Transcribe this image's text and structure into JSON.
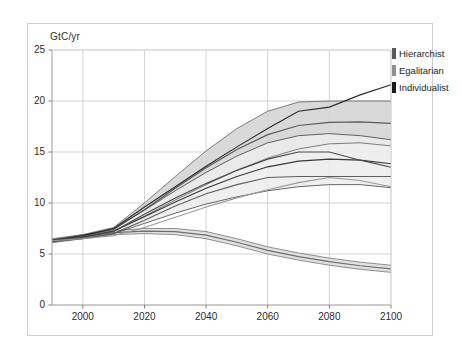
{
  "figure": {
    "unit_label": "GtC/yr",
    "frame": {
      "border_color": "#cfcfcf",
      "background": "#ffffff"
    }
  },
  "legend": {
    "position": "top-right-outside",
    "entries": [
      {
        "label": "Hierarchist",
        "swatch_color": "#5a5a5a"
      },
      {
        "label": "Egalitarian",
        "swatch_color": "#8f8f8f"
      },
      {
        "label": "Individualist",
        "swatch_color": "#1a1a1a"
      }
    ]
  },
  "chart_data": {
    "type": "line",
    "title": "",
    "subtitle": "",
    "xlabel": "",
    "ylabel": "GtC/yr",
    "xlim": [
      1990,
      2100
    ],
    "ylim": [
      0,
      25
    ],
    "xticks": [
      2000,
      2020,
      2040,
      2060,
      2080,
      2100
    ],
    "yticks": [
      0,
      5,
      10,
      15,
      20,
      25
    ],
    "grid": true,
    "grid_color": "#c8c8c8",
    "x": [
      1990,
      2000,
      2010,
      2020,
      2030,
      2040,
      2050,
      2060,
      2070,
      2080,
      2090,
      2100
    ],
    "series": [
      {
        "name": "Hierarchist",
        "kind": "band",
        "color": "#5a5a5a",
        "fill": "#d2d2d2",
        "upper": [
          6.4,
          6.9,
          7.6,
          10.0,
          12.6,
          15.1,
          17.3,
          19.0,
          19.9,
          20.0,
          20.0,
          20.0
        ],
        "lower": [
          6.2,
          6.6,
          7.2,
          8.7,
          10.3,
          11.8,
          13.2,
          14.4,
          15.3,
          15.8,
          15.9,
          15.6
        ],
        "center": [
          6.3,
          6.75,
          7.4,
          9.35,
          11.45,
          13.45,
          15.25,
          16.7,
          17.6,
          17.9,
          17.95,
          17.8
        ]
      },
      {
        "name": "Egalitarian",
        "kind": "band",
        "color": "#6e6e6e",
        "fill": "#dcdcdc",
        "upper": [
          6.5,
          6.9,
          7.3,
          7.5,
          7.5,
          7.2,
          6.5,
          5.7,
          5.1,
          4.6,
          4.2,
          3.9
        ],
        "lower": [
          6.1,
          6.5,
          6.9,
          7.0,
          6.9,
          6.5,
          5.8,
          5.0,
          4.4,
          3.9,
          3.5,
          3.2
        ],
        "center": [
          6.3,
          6.7,
          7.1,
          7.25,
          7.2,
          6.85,
          6.15,
          5.35,
          4.75,
          4.25,
          3.85,
          3.55
        ]
      },
      {
        "name": "Individualist",
        "kind": "band",
        "color": "#3a3a3a",
        "fill": "#ececec",
        "upper": [
          6.4,
          6.8,
          7.5,
          9.3,
          11.2,
          13.0,
          14.6,
          15.9,
          16.6,
          16.8,
          16.6,
          16.2
        ],
        "lower": [
          6.2,
          6.5,
          7.0,
          8.0,
          9.0,
          9.9,
          10.6,
          11.2,
          11.6,
          11.8,
          11.8,
          11.5
        ],
        "center": [
          6.3,
          6.65,
          7.25,
          8.65,
          10.1,
          11.45,
          12.6,
          13.55,
          14.1,
          14.3,
          14.2,
          13.85
        ]
      }
    ],
    "reference_lines": [
      {
        "name": "individualist-main",
        "color": "#2b2b2b",
        "values": [
          6.3,
          6.8,
          7.5,
          9.6,
          11.6,
          13.6,
          15.5,
          17.3,
          19.0,
          19.4,
          20.6,
          21.6
        ]
      },
      {
        "name": "hierarchist-main",
        "color": "#4a4a4a",
        "values": [
          6.3,
          6.7,
          7.2,
          8.9,
          10.5,
          11.9,
          13.2,
          14.3,
          15.0,
          15.0,
          14.2,
          13.5
        ]
      },
      {
        "name": "mid-flat-line",
        "color": "#5f5f5f",
        "values": [
          6.3,
          6.6,
          7.0,
          8.3,
          9.7,
          10.9,
          11.8,
          12.5,
          12.6,
          12.6,
          12.6,
          12.6
        ]
      },
      {
        "name": "lower-rising-line",
        "color": "#9a9a9a",
        "values": [
          6.3,
          6.5,
          6.8,
          7.6,
          8.6,
          9.6,
          10.5,
          11.3,
          12.0,
          12.5,
          12.2,
          11.6
        ]
      }
    ]
  }
}
